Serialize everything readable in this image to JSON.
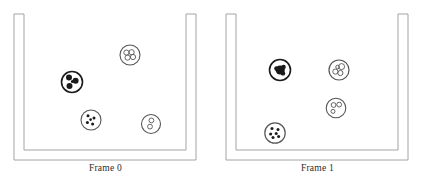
{
  "figure": {
    "panel_count": 2,
    "background_color": "#ffffff",
    "line_color": "#9a9a9a",
    "cell_outline_color": "#555555",
    "cell_fill_color": "#ffffff",
    "organelle_dark_color": "#1a1a1a",
    "canvas": {
      "width": 423,
      "height": 190
    }
  },
  "panels": [
    {
      "id": "frame-0",
      "caption": "Frame 0",
      "container": {
        "name": "beaker",
        "shape": "u-shaped-vessel",
        "outer": {
          "x": 14,
          "y": 14,
          "width": 182,
          "height": 146,
          "wall_thickness": 10
        },
        "inner": {
          "x": 24,
          "y": 14,
          "width": 162,
          "height": 136
        }
      },
      "cells": [
        {
          "name": "cell-trefoil",
          "cx": 72,
          "cy": 82,
          "r": 10.5,
          "outline_width": 1.6,
          "style": "dark-trefoil",
          "organelles": [
            {
              "cx": 69.0,
              "cy": 77.6,
              "r": 3.0,
              "filled": true
            },
            {
              "cx": 75.6,
              "cy": 80.8,
              "r": 3.0,
              "filled": true
            },
            {
              "cx": 69.5,
              "cy": 86.0,
              "r": 3.0,
              "filled": true
            },
            {
              "cx": 72.4,
              "cy": 81.6,
              "r": 1.5,
              "filled": true
            }
          ]
        },
        {
          "name": "cell-rings-cluster",
          "cx": 130,
          "cy": 55,
          "r": 10.0,
          "outline_width": 1.1,
          "style": "light-rings",
          "organelles": [
            {
              "cx": 126.4,
              "cy": 52.6,
              "r": 2.6,
              "filled": false
            },
            {
              "cx": 131.6,
              "cy": 52.2,
              "r": 2.6,
              "filled": false
            },
            {
              "cx": 127.6,
              "cy": 57.6,
              "r": 2.6,
              "filled": false
            },
            {
              "cx": 133.0,
              "cy": 57.0,
              "r": 2.6,
              "filled": false
            }
          ]
        },
        {
          "name": "cell-dots-four",
          "cx": 91,
          "cy": 120,
          "r": 10.0,
          "outline_width": 1.1,
          "style": "light-dots",
          "organelles": [
            {
              "cx": 88.0,
              "cy": 115.8,
              "r": 1.5,
              "filled": true
            },
            {
              "cx": 94.0,
              "cy": 118.0,
              "r": 1.5,
              "filled": true
            },
            {
              "cx": 87.4,
              "cy": 122.6,
              "r": 1.5,
              "filled": true
            },
            {
              "cx": 92.6,
              "cy": 124.0,
              "r": 1.5,
              "filled": true
            },
            {
              "cx": 90.6,
              "cy": 119.6,
              "r": 1.3,
              "filled": true
            }
          ]
        },
        {
          "name": "cell-rings-two",
          "cx": 151,
          "cy": 124,
          "r": 9.5,
          "outline_width": 1.1,
          "style": "light-rings",
          "organelles": [
            {
              "cx": 151.4,
              "cy": 120.4,
              "r": 2.4,
              "filled": false
            },
            {
              "cx": 150.0,
              "cy": 126.6,
              "r": 2.4,
              "filled": false
            }
          ]
        }
      ]
    },
    {
      "id": "frame-1",
      "caption": "Frame 1",
      "container": {
        "name": "beaker",
        "shape": "u-shaped-vessel",
        "outer": {
          "x": 14,
          "y": 14,
          "width": 182,
          "height": 146,
          "wall_thickness": 10
        },
        "inner": {
          "x": 24,
          "y": 14,
          "width": 162,
          "height": 136
        }
      },
      "cells": [
        {
          "name": "cell-solid-blob",
          "cx": 68,
          "cy": 70,
          "r": 10.5,
          "outline_width": 1.6,
          "style": "dark-blob",
          "organelles": [
            {
              "cx": 68.2,
              "cy": 70.0,
              "r": 4.6,
              "filled": true
            },
            {
              "cx": 64.6,
              "cy": 68.6,
              "r": 2.4,
              "filled": true
            },
            {
              "cx": 71.6,
              "cy": 67.0,
              "r": 2.2,
              "filled": true
            },
            {
              "cx": 71.0,
              "cy": 73.4,
              "r": 2.2,
              "filled": true
            }
          ]
        },
        {
          "name": "cell-rings-cluster",
          "cx": 127,
          "cy": 70,
          "r": 10.0,
          "outline_width": 1.2,
          "style": "light-rings",
          "organelles": [
            {
              "cx": 123.4,
              "cy": 71.6,
              "r": 2.6,
              "filled": false
            },
            {
              "cx": 128.4,
              "cy": 73.0,
              "r": 2.6,
              "filled": false
            },
            {
              "cx": 129.6,
              "cy": 66.6,
              "r": 3.0,
              "filled": false
            },
            {
              "cx": 125.6,
              "cy": 67.0,
              "r": 1.8,
              "filled": false
            }
          ]
        },
        {
          "name": "cell-rings-two",
          "cx": 124,
          "cy": 108,
          "r": 9.8,
          "outline_width": 1.1,
          "style": "light-rings",
          "organelles": [
            {
              "cx": 121.6,
              "cy": 105.0,
              "r": 2.4,
              "filled": false
            },
            {
              "cx": 127.2,
              "cy": 104.6,
              "r": 2.4,
              "filled": false
            },
            {
              "cx": 121.0,
              "cy": 111.4,
              "r": 2.0,
              "filled": false
            }
          ]
        },
        {
          "name": "cell-dots-six",
          "cx": 63,
          "cy": 133,
          "r": 10.2,
          "outline_width": 1.2,
          "style": "light-dots",
          "organelles": [
            {
              "cx": 60.0,
              "cy": 128.6,
              "r": 1.5,
              "filled": true
            },
            {
              "cx": 66.0,
              "cy": 129.6,
              "r": 1.5,
              "filled": true
            },
            {
              "cx": 58.6,
              "cy": 134.0,
              "r": 1.5,
              "filled": true
            },
            {
              "cx": 64.2,
              "cy": 133.4,
              "r": 1.5,
              "filled": true
            },
            {
              "cx": 61.0,
              "cy": 137.6,
              "r": 1.5,
              "filled": true
            },
            {
              "cx": 66.6,
              "cy": 136.6,
              "r": 1.5,
              "filled": true
            }
          ]
        }
      ]
    }
  ]
}
